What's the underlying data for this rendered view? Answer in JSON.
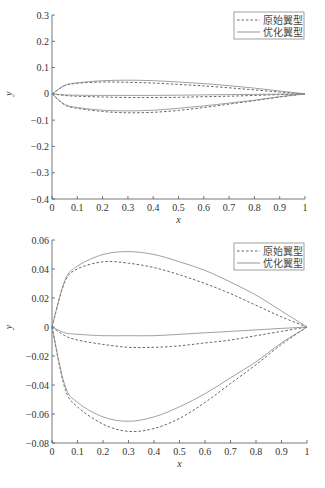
{
  "chart_data": [
    {
      "type": "line",
      "title": "",
      "xlabel": "x",
      "ylabel": "y",
      "xlim": [
        0,
        1
      ],
      "ylim": [
        -0.4,
        0.3
      ],
      "xticks": [
        "0",
        "0.1",
        "0.2",
        "0.3",
        "0.4",
        "0.5",
        "0.6",
        "0.7",
        "0.8",
        "0.9",
        "1"
      ],
      "yticks": [
        "0.3",
        "0.2",
        "0.1",
        "0",
        "−0.1",
        "−0.2",
        "−0.3",
        "−0.4"
      ],
      "legend": {
        "position": "upper right",
        "entries": [
          "原始翼型",
          "优化翼型"
        ]
      },
      "grid": false,
      "series": [
        {
          "name": "原始翼型",
          "style": "dashed",
          "x": [
            0,
            0.05,
            0.1,
            0.2,
            0.3,
            0.4,
            0.5,
            0.6,
            0.7,
            0.8,
            0.9,
            1.0
          ],
          "upper": [
            0,
            0.031,
            0.04,
            0.045,
            0.044,
            0.041,
            0.036,
            0.03,
            0.023,
            0.015,
            0.007,
            0
          ],
          "camber": [
            0,
            -0.006,
            -0.009,
            -0.012,
            -0.014,
            -0.014,
            -0.013,
            -0.011,
            -0.009,
            -0.006,
            -0.003,
            0
          ],
          "lower": [
            0,
            -0.042,
            -0.055,
            -0.067,
            -0.072,
            -0.07,
            -0.063,
            -0.052,
            -0.039,
            -0.026,
            -0.012,
            0
          ]
        },
        {
          "name": "优化翼型",
          "style": "solid",
          "x": [
            0,
            0.05,
            0.1,
            0.2,
            0.3,
            0.4,
            0.5,
            0.6,
            0.7,
            0.8,
            0.9,
            1.0
          ],
          "upper": [
            0,
            0.032,
            0.042,
            0.05,
            0.052,
            0.05,
            0.045,
            0.039,
            0.031,
            0.022,
            0.011,
            0
          ],
          "camber": [
            0,
            -0.004,
            -0.005,
            -0.006,
            -0.006,
            -0.006,
            -0.005,
            -0.004,
            -0.003,
            -0.002,
            -0.001,
            0
          ],
          "lower": [
            0,
            -0.04,
            -0.052,
            -0.062,
            -0.065,
            -0.062,
            -0.055,
            -0.046,
            -0.035,
            -0.024,
            -0.011,
            0
          ]
        }
      ]
    },
    {
      "type": "line",
      "title": "",
      "xlabel": "x",
      "ylabel": "y",
      "xlim": [
        0,
        1
      ],
      "ylim": [
        -0.08,
        0.06
      ],
      "xticks": [
        "0",
        "0.1",
        "0.2",
        "0.3",
        "0.4",
        "0.5",
        "0.6",
        "0.7",
        "0.8",
        "0.9",
        "1"
      ],
      "yticks": [
        "0.06",
        "0.04",
        "0.02",
        "0",
        "−0.02",
        "−0.04",
        "−0.06",
        "−0.08"
      ],
      "legend": {
        "position": "upper right",
        "entries": [
          "原始翼型",
          "优化翼型"
        ]
      },
      "grid": false,
      "series": "same as chart 1 (zoomed y-range)"
    }
  ]
}
